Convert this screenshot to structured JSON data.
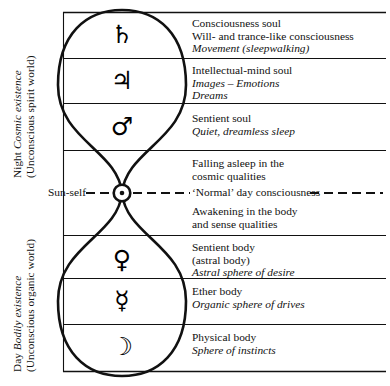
{
  "diagram": {
    "ink_color": "#111111",
    "background": "#ffffff",
    "box": {
      "left": 63,
      "right": 386,
      "top": 12,
      "bottom": 372
    },
    "dividers": [
      58,
      103,
      150,
      235,
      278,
      324
    ],
    "crossing_point": {
      "x": 122,
      "y": 193
    }
  },
  "side_labels": {
    "night": {
      "lead": "Night ",
      "emphasis": "Cosmic existence",
      "sub": "(Unconscious spirit world)"
    },
    "day": {
      "lead": "Day ",
      "emphasis": "Bodily existence",
      "sub": "(Unconscious organic world)"
    }
  },
  "sun_self": {
    "label": "Sun-self",
    "symbol": "☉",
    "symbol_name": "sun-symbol"
  },
  "normal_day": {
    "label": "‘Normal’ day consciousness"
  },
  "rows": [
    {
      "glyph": "♄",
      "glyph_name": "saturn-glyph",
      "planet": "Saturn",
      "lines": [
        "Consciousness soul",
        "Will- and trance-like consciousness"
      ],
      "italic_lines": [
        "Movement (sleepwalking)"
      ]
    },
    {
      "glyph": "♃",
      "glyph_name": "jupiter-glyph",
      "planet": "Jupiter",
      "lines": [
        "Intellectual-mind soul"
      ],
      "italic_lines": [
        "Images – Emotions",
        "Dreams"
      ]
    },
    {
      "glyph": "♂",
      "glyph_name": "mars-glyph",
      "planet": "Mars",
      "lines": [
        "Sentient soul"
      ],
      "italic_lines": [
        "Quiet, dreamless sleep"
      ]
    },
    {
      "glyph": "",
      "glyph_name": "no-glyph",
      "planet": "",
      "lines": [
        "Falling asleep in the",
        "cosmic qualities"
      ],
      "italic_lines": []
    },
    {
      "glyph": "",
      "glyph_name": "no-glyph",
      "planet": "",
      "lines": [
        "Awakening in the body",
        "and sense qualities"
      ],
      "italic_lines": []
    },
    {
      "glyph": "♀",
      "glyph_name": "venus-glyph",
      "planet": "Venus",
      "lines": [
        "Sentient body",
        "(astral body)"
      ],
      "italic_lines": [
        "Astral sphere of desire"
      ]
    },
    {
      "glyph": "☿",
      "glyph_name": "mercury-glyph",
      "planet": "Mercury",
      "lines": [
        "Ether body"
      ],
      "italic_lines": [
        "Organic sphere of drives"
      ]
    },
    {
      "glyph": "☽",
      "glyph_name": "moon-glyph",
      "planet": "Moon",
      "lines": [
        "Physical body"
      ],
      "italic_lines": [
        "Sphere of instincts"
      ]
    }
  ]
}
